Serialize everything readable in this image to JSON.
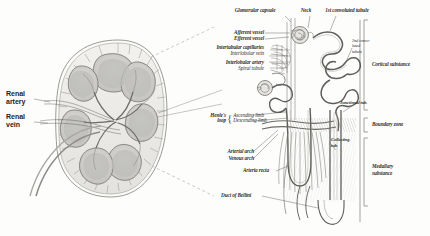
{
  "figure": {
    "style": "engraved halftone, italic serif labels"
  },
  "left_panel": {
    "name": "kidney-coronal-section",
    "labels": [
      {
        "id": "renal-artery",
        "text": "Renal\nartery",
        "line1": "Renal",
        "line2": "artery"
      },
      {
        "id": "renal-vein",
        "text": "Renal\nvein",
        "line1": "Renal",
        "line2": "vein"
      }
    ]
  },
  "right_panel": {
    "name": "nephron-detail",
    "top_labels": [
      {
        "id": "glomerular-capsule",
        "text": "Glomerular capsule"
      },
      {
        "id": "neck",
        "text": "Neck"
      },
      {
        "id": "first-convoluted-tubule",
        "text": "1st convoluted tubule"
      }
    ],
    "left_labels": [
      {
        "id": "afferent-vessel",
        "text": "Afferent vessel"
      },
      {
        "id": "efferent-vessel",
        "text": "Efferent vessel"
      },
      {
        "id": "intertubular-capillaries",
        "text": "Intertubular capillaries"
      },
      {
        "id": "interlobular-vein",
        "text": "Interlobular vein"
      },
      {
        "id": "interlobular-artery",
        "text": "Interlobular artery"
      },
      {
        "id": "spiral-tubule",
        "text": "Spiral tubule"
      },
      {
        "id": "arterial-arch",
        "text": "Arterial arch"
      },
      {
        "id": "venous-arch",
        "text": "Venous arch"
      },
      {
        "id": "arteria-recta",
        "text": "Arteria recta"
      },
      {
        "id": "duct-of-bellini",
        "text": "Duct of Bellini"
      }
    ],
    "henle": {
      "id": "henles-loop",
      "line1": "Henle's",
      "line2": "loop",
      "limb1": "Ascending limb",
      "limb2": "Descending limb"
    },
    "inner_labels": [
      {
        "id": "second-convoluted-tubule",
        "text": "2nd convo-\nluted\ntubule",
        "l1": "2nd convo-",
        "l2": "luted",
        "l3": "tubule"
      },
      {
        "id": "junctional-tubule",
        "text": "Junctional tub."
      },
      {
        "id": "collecting-tubule",
        "text": "Collecting\ntub.",
        "l1": "Collecting",
        "l2": "tub."
      }
    ],
    "zone_labels": [
      {
        "id": "cortical-substance",
        "text": "Cortical substance"
      },
      {
        "id": "boundary-zone",
        "text": "Boundary zone"
      },
      {
        "id": "medullary-substance",
        "l1": "Medullary",
        "l2": "substance"
      }
    ]
  },
  "colors": {
    "paper": "#fdfdfc",
    "ink": "#2e2e2c",
    "line": "#5c5c58",
    "dash": "#9aa7b4",
    "tissue_light": "#e8e7e3",
    "tissue_mid": "#cfcecb",
    "tissue_dark": "#a9a8a4",
    "vessel": "#8d8c88"
  }
}
